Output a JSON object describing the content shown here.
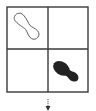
{
  "diagram": {
    "type": "step-grid",
    "grid": {
      "rows": 2,
      "cols": 2,
      "line_color": "#3a3a3a",
      "background": "#ffffff"
    },
    "cells": [
      {
        "row": 0,
        "col": 0,
        "content": "footprint-outline",
        "fill": "none",
        "stroke": "#555555"
      },
      {
        "row": 0,
        "col": 1,
        "content": "empty"
      },
      {
        "row": 1,
        "col": 0,
        "content": "empty"
      },
      {
        "row": 1,
        "col": 1,
        "content": "footprint-filled",
        "fill": "#222222"
      }
    ],
    "arrow": {
      "direction": "down",
      "color": "#333333"
    }
  }
}
